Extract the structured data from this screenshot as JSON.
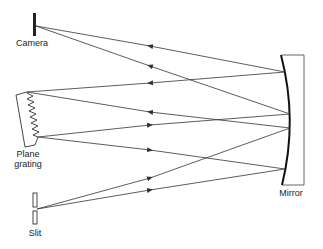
{
  "diagram": {
    "labels": {
      "camera": "Camera",
      "grating_line1": "Plane",
      "grating_line2": "grating",
      "slit": "Slit",
      "mirror": "Mirror"
    },
    "colors": {
      "line": "#333333",
      "background": "#ffffff"
    },
    "components": [
      "Camera",
      "Plane grating",
      "Slit",
      "Mirror"
    ],
    "rays": [
      {
        "from": "Slit",
        "to": "Mirror",
        "direction": "right"
      },
      {
        "from": "Slit",
        "to": "Mirror",
        "direction": "right"
      },
      {
        "from": "Mirror",
        "to": "Plane grating",
        "direction": "left"
      },
      {
        "from": "Mirror",
        "to": "Plane grating",
        "direction": "left"
      },
      {
        "from": "Plane grating",
        "to": "Mirror",
        "direction": "right"
      },
      {
        "from": "Plane grating",
        "to": "Mirror",
        "direction": "right"
      },
      {
        "from": "Mirror",
        "to": "Camera",
        "direction": "left"
      },
      {
        "from": "Mirror",
        "to": "Camera",
        "direction": "left"
      }
    ]
  }
}
